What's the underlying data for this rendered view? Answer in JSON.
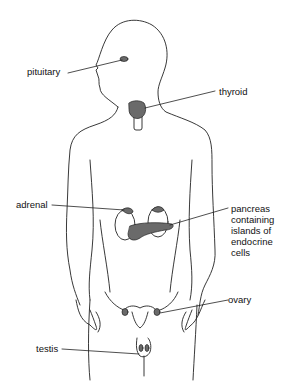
{
  "diagram": {
    "type": "anatomy-figure",
    "labels": {
      "pituitary": "pituitary",
      "thyroid": "thyroid",
      "adrenal": "adrenal",
      "pancreas": "pancreas\ncontaining\nislands of\nendocrine\ncells",
      "ovary": "ovary",
      "testis": "testis"
    },
    "colors": {
      "outline": "#222222",
      "gland_fill": "#6a6a6a",
      "background": "#ffffff"
    }
  }
}
